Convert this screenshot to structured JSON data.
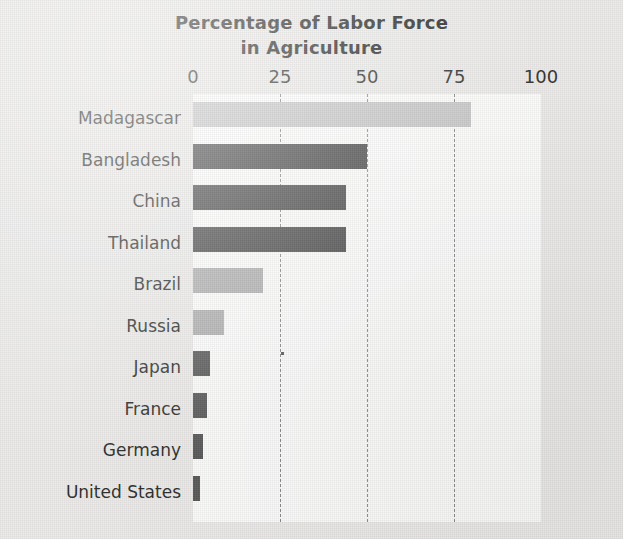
{
  "chart_data": {
    "type": "bar",
    "orientation": "horizontal",
    "title": "Percentage of Labor Force in Agriculture",
    "title_lines": [
      "Percentage of Labor Force",
      "in Agriculture"
    ],
    "xlabel": "",
    "ylabel": "",
    "xlim": [
      0,
      100
    ],
    "xticks": [
      0,
      25,
      50,
      75,
      100
    ],
    "xtick_labels": [
      "0",
      "25",
      "50",
      "75",
      "100"
    ],
    "grid": "vertical-dashed",
    "legend": "none",
    "categories": [
      "Madagascar",
      "Bangladesh",
      "China",
      "Thailand",
      "Brazil",
      "Russia",
      "Japan",
      "France",
      "Germany",
      "United States"
    ],
    "values": [
      80,
      50,
      44,
      44,
      20,
      9,
      5,
      4,
      3,
      2
    ],
    "bar_colors": [
      "#c8c8c8",
      "#4b4b4b",
      "#4b4b4b",
      "#4b4b4b",
      "#b0b0b0",
      "#b0b0b0",
      "#5a5a5a",
      "#5a5a5a",
      "#5a5a5a",
      "#5a5a5a"
    ],
    "bars": [
      {
        "label": "Madagascar",
        "value": 80,
        "color": "#c8c8c8"
      },
      {
        "label": "Bangladesh",
        "value": 50,
        "color": "#4b4b4b"
      },
      {
        "label": "China",
        "value": 44,
        "color": "#4b4b4b"
      },
      {
        "label": "Thailand",
        "value": 44,
        "color": "#4b4b4b"
      },
      {
        "label": "Brazil",
        "value": 20,
        "color": "#b0b0b0"
      },
      {
        "label": "Russia",
        "value": 9,
        "color": "#b0b0b0"
      },
      {
        "label": "Japan",
        "value": 5,
        "color": "#5a5a5a"
      },
      {
        "label": "France",
        "value": 4,
        "color": "#5a5a5a"
      },
      {
        "label": "Germany",
        "value": 3,
        "color": "#5a5a5a"
      },
      {
        "label": "United States",
        "value": 2,
        "color": "#5a5a5a"
      }
    ]
  },
  "colors": {
    "page_background": "#ecebe9",
    "plot_background": "#fdfdfc",
    "gridline": "#8d8d8d",
    "text": "#2e2e2e",
    "title_text": "#2b2b2b",
    "bar_light": "#c8c8c8",
    "bar_mid": "#b0b0b0",
    "bar_dark": "#4b4b4b"
  }
}
